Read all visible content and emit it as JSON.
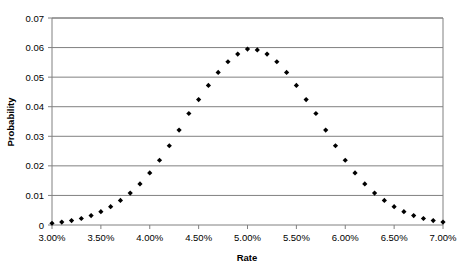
{
  "chart_data": {
    "type": "scatter",
    "title": "",
    "xlabel": "Rate",
    "ylabel": "Probability",
    "xlim": [
      0.03,
      0.07
    ],
    "ylim": [
      0,
      0.07
    ],
    "grid": true,
    "legend": false,
    "marker": "diamond",
    "marker_color": "#000000",
    "xtick_labels": [
      "3.00%",
      "3.50%",
      "4.00%",
      "4.50%",
      "5.00%",
      "5.50%",
      "6.00%",
      "6.50%",
      "7.00%"
    ],
    "xtick_values": [
      0.03,
      0.035,
      0.04,
      0.045,
      0.05,
      0.055,
      0.06,
      0.065,
      0.07
    ],
    "ytick_labels": [
      "0",
      "0.01",
      "0.02",
      "0.03",
      "0.04",
      "0.05",
      "0.06",
      "0.07"
    ],
    "ytick_values": [
      0,
      0.01,
      0.02,
      0.03,
      0.04,
      0.05,
      0.06,
      0.07
    ],
    "x": [
      0.03,
      0.031,
      0.032,
      0.033,
      0.034,
      0.035,
      0.036,
      0.037,
      0.038,
      0.039,
      0.04,
      0.041,
      0.042,
      0.043,
      0.044,
      0.045,
      0.046,
      0.047,
      0.048,
      0.049,
      0.05,
      0.051,
      0.052,
      0.053,
      0.054,
      0.055,
      0.056,
      0.057,
      0.058,
      0.059,
      0.06,
      0.061,
      0.062,
      0.063,
      0.064,
      0.065,
      0.066,
      0.067,
      0.068,
      0.069,
      0.07
    ],
    "y": [
      0.0006,
      0.001,
      0.0015,
      0.0022,
      0.0032,
      0.0045,
      0.0062,
      0.0083,
      0.0108,
      0.0139,
      0.0176,
      0.0219,
      0.0268,
      0.0321,
      0.0377,
      0.0424,
      0.0472,
      0.0516,
      0.0552,
      0.0578,
      0.0595,
      0.0592,
      0.0578,
      0.0552,
      0.0516,
      0.0472,
      0.0424,
      0.0377,
      0.0321,
      0.0268,
      0.0219,
      0.0176,
      0.0139,
      0.0108,
      0.0083,
      0.0062,
      0.0045,
      0.0032,
      0.0022,
      0.0015,
      0.001
    ]
  },
  "style": {
    "axis_color": "#808080",
    "grid_color": "#808080",
    "plot_background": "#ffffff",
    "text_color": "#000000"
  }
}
